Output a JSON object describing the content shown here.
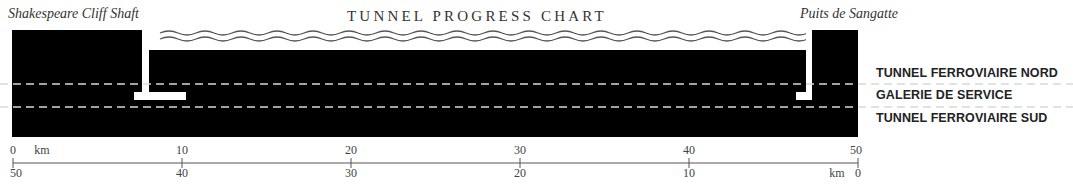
{
  "title": "TUNNEL PROGRESS CHART",
  "shafts": {
    "left": "Shakespeare Cliff Shaft",
    "right": "Puits de Sangatte"
  },
  "layers": [
    {
      "label": "TUNNEL FERROVIAIRE NORD"
    },
    {
      "label": "GALERIE DE SERVICE"
    },
    {
      "label": "TUNNEL FERROVIAIRE SUD"
    }
  ],
  "axis": {
    "unit": "km",
    "top_ticks": [
      "0",
      "10",
      "20",
      "30",
      "40",
      "50"
    ],
    "bottom_ticks": [
      "50",
      "40",
      "30",
      "20",
      "10",
      "0"
    ]
  },
  "colors": {
    "rock": "#000000",
    "tunnel": "#ffffff",
    "dash": "#d9d9d9",
    "axis": "#555555"
  }
}
